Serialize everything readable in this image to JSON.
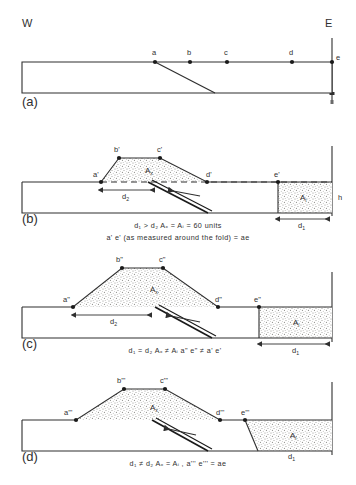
{
  "figure": {
    "title_hidden": "",
    "compass": {
      "west": "W",
      "east": "E"
    },
    "panels": [
      {
        "tag": "(a)",
        "name": "undeformed-state",
        "points": [
          "a",
          "b",
          "c",
          "d",
          "e"
        ],
        "captions": []
      },
      {
        "tag": "(b)",
        "name": "fold-with-excess-area-b",
        "points": [
          "a'",
          "b'",
          "c'",
          "d'",
          "e'"
        ],
        "area_fold": "A",
        "area_fold_sub": "x",
        "area_disp": "A",
        "area_disp_sub": "i",
        "dims": {
          "d1": "d",
          "d1_sub": "1",
          "d2": "d",
          "d2_sub": "2",
          "h": "h"
        },
        "captions": [
          "d₁ > d₂          Aₓ = Aᵢ = 60 units",
          "a' e' (as measured around the fold) = ae"
        ]
      },
      {
        "tag": "(c)",
        "name": "fold-with-excess-area-c",
        "points": [
          "a\"",
          "b\"",
          "c\"",
          "d\"",
          "e\""
        ],
        "area_fold": "A",
        "area_fold_sub": "x",
        "area_disp": "A",
        "area_disp_sub": "i",
        "dims": {
          "d1": "d",
          "d1_sub": "1",
          "d2": "d",
          "d2_sub": "2"
        },
        "captions": [
          "d₁ = d₂        Aₓ ≠ Aᵢ        a\" e\" ≠ a' e'"
        ]
      },
      {
        "tag": "(d)",
        "name": "fold-with-excess-area-d",
        "points": [
          "a'''",
          "b'''",
          "c'''",
          "d'''",
          "e'''"
        ],
        "area_fold": "A",
        "area_fold_sub": "x",
        "area_disp": "A",
        "area_disp_sub": "i",
        "dims": {
          "d1": "d",
          "d1_sub": "1",
          "d2": "d",
          "d2_sub": "2"
        },
        "captions": [
          "d₁ ≠ d₂     Aₓ = Aᵢ , a''' e''' = ae"
        ]
      }
    ],
    "colors": {
      "line": "#2f2f2f",
      "stipple": "#d8d8d4",
      "background": "#ffffff",
      "thrust": "#1a1a1a"
    }
  }
}
